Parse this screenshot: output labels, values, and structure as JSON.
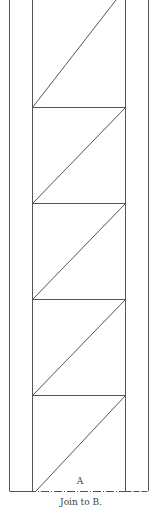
{
  "diagram": {
    "section_label": "A",
    "caption": "Join to B.",
    "line_color": "#555555",
    "background": "#ffffff",
    "outer_border": {
      "left_x": 9,
      "right_x": 148
    },
    "inner_strip": {
      "left_x": 32,
      "right_x": 125
    },
    "cell_rows_y": [
      0,
      107,
      203,
      299,
      395,
      491
    ],
    "diagonals": "bottom-left to top-right in each cell",
    "bottom_edge_style": "dash-dot"
  }
}
